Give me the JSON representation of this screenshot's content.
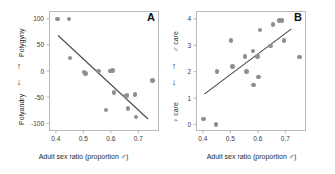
{
  "figure": {
    "background": "#ffffff",
    "point_color": "#8f8f8f",
    "line_color": "#4a4a4a",
    "frame_color": "#b9b9b9"
  },
  "panels": [
    {
      "letter": "A",
      "xlabel": "Adult sex ratio (proportion ♂)",
      "xticks": [
        "0.4",
        "0.5",
        "0.6",
        "0.7"
      ],
      "yticks": [
        "100",
        "50",
        "0",
        "-50",
        "-100"
      ],
      "ylabel_top": "Polygyny",
      "ylabel_bottom": "Polyandry",
      "arrow_up": "↑",
      "arrow_down": "↓"
    },
    {
      "letter": "B",
      "xlabel": "Adult sex ratio (proportion ♂)",
      "xticks": [
        "0.4",
        "0.5",
        "0.6",
        "0.7"
      ],
      "yticks": [
        "4",
        "3",
        "2",
        "1",
        "0"
      ],
      "ylabel_top": "♂ care",
      "ylabel_bottom": "♀ care",
      "arrow_up": "↑",
      "arrow_down": "↓"
    }
  ],
  "chart_data": [
    {
      "type": "scatter",
      "panel": "A",
      "title": "",
      "xlabel": "Adult sex ratio (proportion ♂)",
      "ylabel": "Polygyny ↑ / ↓ Polyandry",
      "xlim": [
        0.375,
        0.775
      ],
      "ylim": [
        -115,
        115
      ],
      "xticks": [
        0.4,
        0.5,
        0.6,
        0.7
      ],
      "yticks": [
        100,
        50,
        0,
        -50,
        -100
      ],
      "grid": false,
      "legend": "none",
      "points": [
        {
          "x": 0.405,
          "y": 100
        },
        {
          "x": 0.448,
          "y": 100
        },
        {
          "x": 0.452,
          "y": 25
        },
        {
          "x": 0.503,
          "y": -2
        },
        {
          "x": 0.507,
          "y": -5
        },
        {
          "x": 0.555,
          "y": 0
        },
        {
          "x": 0.598,
          "y": 0
        },
        {
          "x": 0.605,
          "y": 1
        },
        {
          "x": 0.582,
          "y": -75
        },
        {
          "x": 0.612,
          "y": -41
        },
        {
          "x": 0.652,
          "y": -48
        },
        {
          "x": 0.658,
          "y": -47
        },
        {
          "x": 0.662,
          "y": -72
        },
        {
          "x": 0.688,
          "y": -45
        },
        {
          "x": 0.692,
          "y": -88
        },
        {
          "x": 0.752,
          "y": -18
        }
      ],
      "fit_line": {
        "x1": 0.408,
        "y1": 68,
        "x2": 0.735,
        "y2": -92
      }
    },
    {
      "type": "scatter",
      "panel": "B",
      "title": "",
      "xlabel": "Adult sex ratio (proportion ♂)",
      "ylabel": "♂ care ↑ / ↓ ♀ care",
      "xlim": [
        0.375,
        0.775
      ],
      "ylim": [
        -0.25,
        4.3
      ],
      "xticks": [
        0.4,
        0.5,
        0.6,
        0.7
      ],
      "yticks": [
        0,
        1,
        2,
        3,
        4
      ],
      "grid": false,
      "legend": "none",
      "points": [
        {
          "x": 0.402,
          "y": 0.2
        },
        {
          "x": 0.448,
          "y": 0.0
        },
        {
          "x": 0.452,
          "y": 2.0
        },
        {
          "x": 0.503,
          "y": 3.18
        },
        {
          "x": 0.508,
          "y": 2.2
        },
        {
          "x": 0.553,
          "y": 2.58
        },
        {
          "x": 0.558,
          "y": 2.0
        },
        {
          "x": 0.582,
          "y": 2.78
        },
        {
          "x": 0.585,
          "y": 1.5
        },
        {
          "x": 0.598,
          "y": 2.58
        },
        {
          "x": 0.602,
          "y": 1.8
        },
        {
          "x": 0.608,
          "y": 3.58
        },
        {
          "x": 0.645,
          "y": 2.98
        },
        {
          "x": 0.655,
          "y": 3.78
        },
        {
          "x": 0.678,
          "y": 3.95
        },
        {
          "x": 0.688,
          "y": 3.95
        },
        {
          "x": 0.695,
          "y": 3.18
        },
        {
          "x": 0.752,
          "y": 2.55
        }
      ],
      "fit_line": {
        "x1": 0.405,
        "y1": 1.15,
        "x2": 0.722,
        "y2": 3.62
      }
    }
  ]
}
